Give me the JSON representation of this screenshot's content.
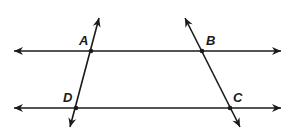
{
  "diagram": {
    "type": "geometry",
    "lines": [
      {
        "id": "top-line",
        "x1": 14,
        "y1": 51,
        "x2": 281,
        "y2": 51,
        "arrows": "both"
      },
      {
        "id": "bottom-line",
        "x1": 14,
        "y1": 108,
        "x2": 281,
        "y2": 108,
        "arrows": "both"
      },
      {
        "id": "left-transversal",
        "x1": 99,
        "y1": 18,
        "x2": 70,
        "y2": 127,
        "arrows": "both"
      },
      {
        "id": "right-transversal",
        "x1": 185,
        "y1": 18,
        "x2": 240,
        "y2": 127,
        "arrows": "both"
      }
    ],
    "points": [
      {
        "label": "A",
        "x": 91,
        "y": 51,
        "label_x": 79,
        "label_y": 45
      },
      {
        "label": "B",
        "x": 202,
        "y": 51,
        "label_x": 206,
        "label_y": 45
      },
      {
        "label": "C",
        "x": 230,
        "y": 108,
        "label_x": 233,
        "label_y": 102
      },
      {
        "label": "D",
        "x": 76,
        "y": 108,
        "label_x": 63,
        "label_y": 102
      }
    ],
    "colors": {
      "stroke": "#1a1a1a",
      "background": "#ffffff"
    }
  }
}
